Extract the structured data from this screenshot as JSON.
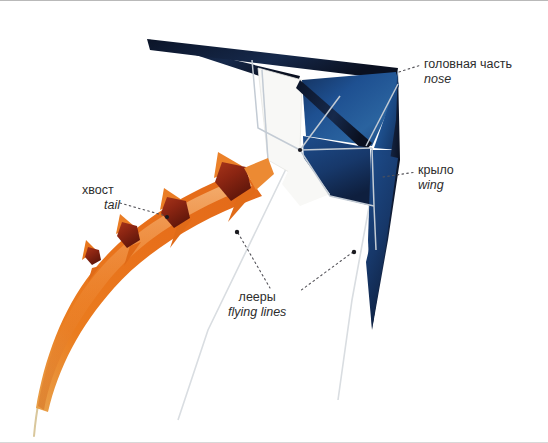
{
  "figure": {
    "background_color": "#ffffff",
    "border_color": "#b9b9b9"
  },
  "colors": {
    "sail_blue": "#1b4a86",
    "sail_blue_mid": "#21589b",
    "sail_blue_light": "#2e6aa8",
    "sail_navy_dark": "#101d38",
    "sail_white": "#f7f7f5",
    "frame_line": "#b6bfc9",
    "flying_line": "#d2d6da",
    "tail_orange": "#e8761c",
    "tail_orange_light": "#f09a49",
    "tail_red": "#8d2512",
    "tail_red_dark": "#6d1a0c",
    "label_text": "#2d2d2d",
    "leader_line": "#55545a"
  },
  "labels": [
    {
      "id": "nose",
      "ru": "головная часть",
      "en": "nose",
      "anchor_x": 396,
      "anchor_y": 72
    },
    {
      "id": "wing",
      "ru": "крыло",
      "en": "wing",
      "anchor_x": 381,
      "anchor_y": 176
    },
    {
      "id": "tail",
      "ru": "хвост",
      "en": "tail",
      "anchor_x": 168,
      "anchor_y": 217
    },
    {
      "id": "flying_lines",
      "ru": "лееры",
      "en": "flying lines",
      "anchor_x_left": 238,
      "anchor_y_left": 233,
      "anchor_x_right": 355,
      "anchor_y_right": 253
    }
  ],
  "tail_ornaments": [
    {
      "index": 1,
      "cx": 92,
      "cy": 255,
      "size": 9
    },
    {
      "index": 2,
      "cx": 128,
      "cy": 236,
      "size": 13
    },
    {
      "index": 3,
      "cx": 175,
      "cy": 213,
      "size": 16
    },
    {
      "index": 4,
      "cx": 233,
      "cy": 185,
      "size": 21
    }
  ]
}
